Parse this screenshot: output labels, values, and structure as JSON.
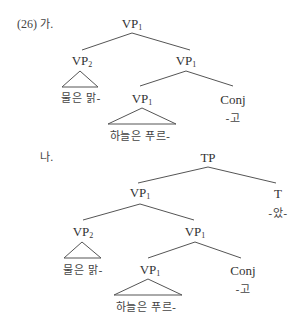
{
  "example": {
    "number": "(26)",
    "a_label": "가.",
    "b_label": "나."
  },
  "tree_a": {
    "root": {
      "cat": "VP",
      "sub": "1"
    },
    "left": {
      "cat": "VP",
      "sub": "2",
      "terminal": "물은 맑-"
    },
    "right": {
      "cat": "VP",
      "sub": "1"
    },
    "right_left": {
      "cat": "VP",
      "sub": "1",
      "terminal": "하늘은 푸르-"
    },
    "right_right": {
      "cat": "Conj",
      "terminal": "-고"
    }
  },
  "tree_b": {
    "root": {
      "cat": "TP"
    },
    "left": {
      "cat": "VP",
      "sub": "1"
    },
    "right": {
      "cat": "T",
      "terminal": "-았-"
    },
    "left_left": {
      "cat": "VP",
      "sub": "2",
      "terminal": "물은 맑-"
    },
    "left_right": {
      "cat": "VP",
      "sub": "1"
    },
    "left_right_left": {
      "cat": "VP",
      "sub": "1",
      "terminal": "하늘은 푸르-"
    },
    "left_right_right": {
      "cat": "Conj",
      "terminal": "-고"
    }
  }
}
